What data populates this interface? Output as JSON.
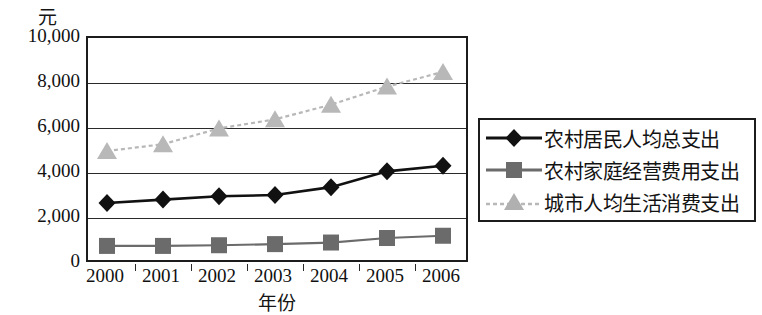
{
  "chart_data": {
    "type": "line",
    "title": "",
    "ylabel": "元",
    "xlabel": "年份",
    "categories": [
      "2000",
      "2001",
      "2002",
      "2003",
      "2004",
      "2005",
      "2006"
    ],
    "ylim": [
      0,
      10000
    ],
    "ytick_labels": [
      "10,000",
      "8,000",
      "6,000",
      "4,000",
      "2,000",
      "0"
    ],
    "ytick_values": [
      10000,
      8000,
      6000,
      4000,
      2000,
      0
    ],
    "grid": true,
    "legend_position": "right",
    "series": [
      {
        "name": "农村居民人均总支出",
        "marker": "diamond",
        "color": "#111111",
        "values": [
          2700,
          2850,
          3000,
          3050,
          3400,
          4100,
          4350
        ]
      },
      {
        "name": "农村家庭经营费用支出",
        "marker": "square",
        "color": "#6b6b6b",
        "values": [
          800,
          800,
          830,
          880,
          950,
          1150,
          1250
        ]
      },
      {
        "name": "城市人均生活消费支出",
        "marker": "triangle",
        "color": "#b8b8b8",
        "values": [
          5000,
          5300,
          6000,
          6400,
          7050,
          7850,
          8500
        ]
      }
    ]
  },
  "legend": {
    "items": [
      {
        "label": "农村居民人均总支出",
        "marker": "diamond-marker-icon"
      },
      {
        "label": "农村家庭经营费用支出",
        "marker": "square-marker-icon"
      },
      {
        "label": "城市人均生活消费支出",
        "marker": "triangle-marker-icon"
      }
    ]
  }
}
